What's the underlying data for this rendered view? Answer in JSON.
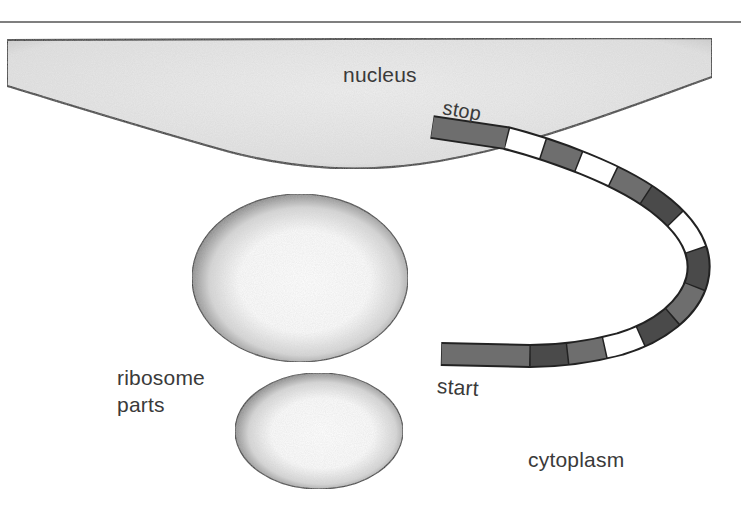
{
  "diagram": {
    "type": "cell biology — translation setup",
    "labels": {
      "nucleus": "nucleus",
      "stop": "stop",
      "start": "start",
      "ribosome_parts_line1": "ribosome",
      "ribosome_parts_line2": "parts",
      "cytoplasm": "cytoplasm"
    },
    "colors": {
      "nucleus_fill": "#e6e6e6",
      "nucleus_outline": "#2a2a2a",
      "rule_line": "#555555",
      "codon_dark": "#4a4a4a",
      "codon_mid": "#6e6e6e",
      "codon_light": "#ffffff",
      "ribosome_edge": "#3a3a3a",
      "ribosome_center": "#ffffff"
    },
    "mrna": {
      "description": "messenger RNA strand running from start codon (bottom) around a curve to stop codon (top, inside nucleus edge)",
      "codons_from_start": [
        "mid",
        "dark",
        "mid",
        "light",
        "dark",
        "mid",
        "dark",
        "light",
        "dark",
        "mid",
        "light",
        "mid",
        "light",
        "mid"
      ]
    },
    "ribosome_parts": {
      "count": 2,
      "shape": "ellipse"
    }
  }
}
